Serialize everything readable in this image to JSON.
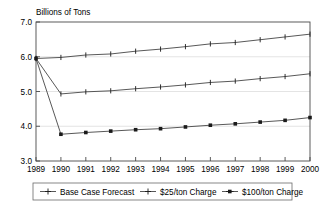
{
  "chart_data": {
    "type": "line",
    "title": "Billions of Tons",
    "xlabel": "",
    "ylabel": "Billions of Tons",
    "x": [
      1989,
      1990,
      1991,
      1992,
      1993,
      1994,
      1995,
      1996,
      1997,
      1998,
      1999,
      2000
    ],
    "categories": [
      "1989",
      "1990",
      "1991",
      "1992",
      "1993",
      "1994",
      "1995",
      "1996",
      "1997",
      "1998",
      "1999",
      "2000"
    ],
    "xlim": [
      1989,
      2000
    ],
    "ylim": [
      3.0,
      7.0
    ],
    "ytick_labels": [
      "3.0",
      "4.0",
      "5.0",
      "6.0",
      "7.0"
    ],
    "ytick_values": [
      3.0,
      4.0,
      5.0,
      6.0,
      7.0
    ],
    "grid": true,
    "legend_position": "bottom",
    "series": [
      {
        "name": "Base Case Forecast",
        "marker": "plus",
        "color": "#3a3a3a",
        "values": [
          5.95,
          5.98,
          6.05,
          6.08,
          6.16,
          6.22,
          6.29,
          6.37,
          6.41,
          6.49,
          6.57,
          6.65
        ]
      },
      {
        "name": "$25/ton Charge",
        "marker": "plus",
        "color": "#3a3a3a",
        "values": [
          5.95,
          4.93,
          4.99,
          5.02,
          5.08,
          5.13,
          5.19,
          5.26,
          5.3,
          5.37,
          5.43,
          5.51
        ]
      },
      {
        "name": "$100/ton Charge",
        "marker": "square",
        "color": "#1a1a1a",
        "values": [
          5.95,
          3.77,
          3.82,
          3.86,
          3.9,
          3.93,
          3.98,
          4.03,
          4.07,
          4.12,
          4.17,
          4.25
        ]
      }
    ]
  },
  "axes": {
    "ytick_0": "3.0",
    "ytick_1": "4.0",
    "ytick_2": "5.0",
    "ytick_3": "6.0",
    "ytick_4": "7.0",
    "xtick_0": "1989",
    "xtick_1": "1990",
    "xtick_2": "1991",
    "xtick_3": "1992",
    "xtick_4": "1993",
    "xtick_5": "1994",
    "xtick_6": "1995",
    "xtick_7": "1996",
    "xtick_8": "1997",
    "xtick_9": "1998",
    "xtick_10": "1999",
    "xtick_11": "2000"
  },
  "title": {
    "text": "Billions of Tons"
  },
  "legend": {
    "entries": [
      {
        "label": "Base Case Forecast",
        "marker": "plus"
      },
      {
        "label": "$25/ton Charge",
        "marker": "plus"
      },
      {
        "label": "$100/ton Charge",
        "marker": "square"
      }
    ],
    "item_0_label": "Base Case Forecast",
    "item_1_label": "$25/ton Charge",
    "item_2_label": "$100/ton Charge"
  },
  "colors": {
    "background": "#ffffff",
    "frame": "#4a4a4a",
    "grid": "#d8d8d8",
    "series": "#3a3a3a",
    "text": "#000000"
  }
}
